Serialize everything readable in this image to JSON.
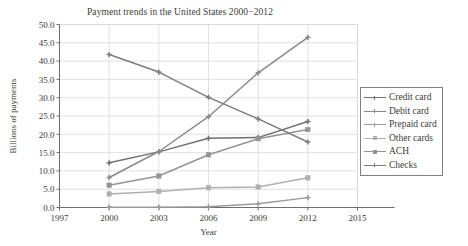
{
  "chart_data": {
    "type": "line",
    "title": "Payment trends in the United States 2000−2012",
    "xlabel": "Year",
    "ylabel": "Billions of payments",
    "x": [
      2000,
      2003,
      2006,
      2009,
      2012
    ],
    "xlim": [
      1997,
      2015
    ],
    "ylim": [
      0.0,
      50.0
    ],
    "xticks": [
      "1997",
      "2000",
      "2003",
      "2006",
      "2009",
      "2012",
      "2015"
    ],
    "xtick_values": [
      1997,
      2000,
      2003,
      2006,
      2009,
      2012,
      2015
    ],
    "yticks": [
      "0.0",
      "5.0",
      "10.0",
      "15.0",
      "20.0",
      "25.0",
      "30.0",
      "35.0",
      "40.0",
      "45.0",
      "50.0"
    ],
    "ytick_values": [
      0,
      5,
      10,
      15,
      20,
      25,
      30,
      35,
      40,
      45,
      50
    ],
    "grid": "horizontal-and-vertical",
    "legend_position": "right-outside",
    "series": [
      {
        "name": "Credit card",
        "values": [
          12.2,
          15.2,
          18.9,
          19.1,
          23.5
        ],
        "color": "#707070",
        "marker": "cross"
      },
      {
        "name": "Debit card",
        "values": [
          8.2,
          15.3,
          24.8,
          36.8,
          46.5
        ],
        "color": "#8a8a8a",
        "marker": "cross"
      },
      {
        "name": "Prepaid card",
        "values": [
          0.1,
          0.1,
          0.2,
          1.0,
          2.7
        ],
        "color": "#9a9a9a",
        "marker": "cross"
      },
      {
        "name": "Other cards",
        "values": [
          3.7,
          4.4,
          5.4,
          5.6,
          8.1
        ],
        "color": "#b0b0b0",
        "marker": "square"
      },
      {
        "name": "ACH",
        "values": [
          6.1,
          8.6,
          14.4,
          18.8,
          21.3
        ],
        "color": "#949494",
        "marker": "square"
      },
      {
        "name": "Checks",
        "values": [
          41.8,
          37.0,
          30.1,
          24.2,
          17.9
        ],
        "color": "#7d7d7d",
        "marker": "cross"
      }
    ]
  },
  "legend": {
    "items": [
      {
        "label": "Credit card"
      },
      {
        "label": "Debit card"
      },
      {
        "label": "Prepaid card"
      },
      {
        "label": "Other cards"
      },
      {
        "label": "ACH"
      },
      {
        "label": "Checks"
      }
    ]
  },
  "colors": {
    "grid": "#d9d9d9",
    "axis": "#6e6e6e",
    "text": "#3c3c3c",
    "legend_border": "#808080",
    "background": "#ffffff"
  }
}
